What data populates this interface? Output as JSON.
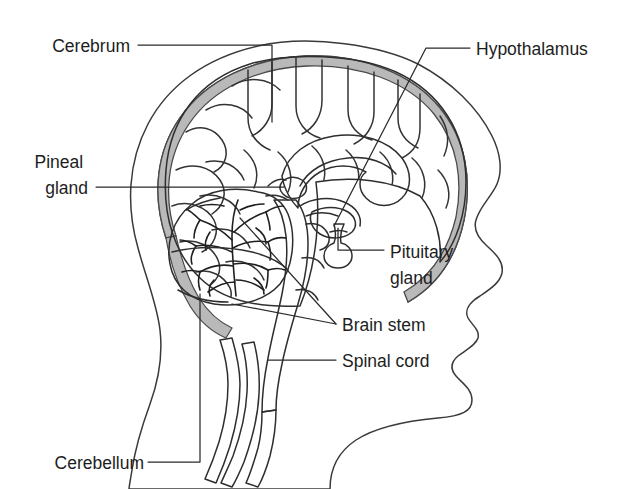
{
  "figure": {
    "background_color": "#ffffff",
    "line_color": "#2e2e2e",
    "label_color": "#1d1d1d"
  },
  "palette": {
    "page_background": "#ffffff",
    "head_fill": "#ffffff",
    "skull_band_fill": "#b9b9b9",
    "cerebrum_fill": "#dcdcdc",
    "cerebellum_fill": "#eaeaea",
    "brainstem_fill": "#c8c8c8",
    "spinal_cord_fill": "#c4c4c4",
    "corpus_callosum_fill": "#fbfbfb",
    "outline_stroke": "#3a3a3a",
    "detail_stroke": "#2e2e2e"
  },
  "labels": [
    {
      "id": "cerebrum",
      "text": "Cerebrum",
      "side": "left",
      "text_x": 130,
      "text_y": 50,
      "structure": "cerebrum"
    },
    {
      "id": "pineal-gland",
      "text": "Pineal gland",
      "line1": "Pineal",
      "line2": "gland",
      "side": "left",
      "text_x": 88,
      "text_y": 168,
      "structure": "pineal-gland"
    },
    {
      "id": "cerebellum",
      "text": "Cerebellum",
      "side": "left",
      "text_x": 144,
      "text_y": 467,
      "structure": "cerebellum"
    },
    {
      "id": "hypothalamus",
      "text": "Hypothalamus",
      "side": "right",
      "text_x": 476,
      "text_y": 53,
      "structure": "hypothalamus"
    },
    {
      "id": "pituitary-gland",
      "text": "Pituitary gland",
      "line1": "Pituitary",
      "line2": "gland",
      "side": "right",
      "text_x": 390,
      "text_y": 258,
      "structure": "pituitary-gland"
    },
    {
      "id": "brain-stem",
      "text": "Brain stem",
      "side": "right",
      "text_x": 342,
      "text_y": 329,
      "structure": "brain-stem"
    },
    {
      "id": "spinal-cord",
      "text": "Spinal cord",
      "side": "right",
      "text_x": 342,
      "text_y": 365,
      "structure": "spinal-cord"
    }
  ],
  "structures": [
    {
      "id": "head-profile",
      "name": "head profile outline"
    },
    {
      "id": "skull",
      "name": "skull and dura band"
    },
    {
      "id": "cerebrum",
      "name": "cerebrum"
    },
    {
      "id": "corpus-callosum",
      "name": "corpus callosum"
    },
    {
      "id": "cerebellum",
      "name": "cerebellum"
    },
    {
      "id": "brain-stem",
      "name": "brain stem"
    },
    {
      "id": "spinal-cord",
      "name": "spinal cord"
    },
    {
      "id": "pituitary-gland",
      "name": "pituitary gland"
    },
    {
      "id": "hypothalamus",
      "name": "hypothalamus"
    },
    {
      "id": "pineal-gland",
      "name": "pineal gland"
    }
  ]
}
